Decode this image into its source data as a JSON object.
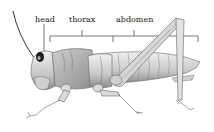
{
  "diagram": {
    "labels": [
      {
        "id": "head",
        "text": "head",
        "x": 35,
        "y": 16
      },
      {
        "id": "thorax",
        "text": "thorax",
        "x": 69,
        "y": 16
      },
      {
        "id": "abdomen",
        "text": "abdomen",
        "x": 116,
        "y": 16
      }
    ],
    "colors": {
      "line": "#555555",
      "body_light": "#e6e6e6",
      "body_mid": "#bdbdbd",
      "body_dark": "#7a7a7a",
      "text": "#222222"
    }
  }
}
